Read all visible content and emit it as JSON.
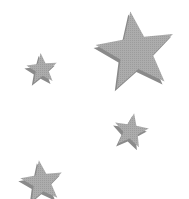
{
  "image": {
    "background": "#ffffff",
    "description": "Four gray five-pointed stars with drop shadows on white background"
  },
  "colors": {
    "star_fill": "#a9a9a9",
    "star_shadow": "#8a8a8a"
  },
  "stars": [
    {
      "name": "large-star",
      "cx": 136,
      "cy": 52,
      "r": 41,
      "rotation": -8
    },
    {
      "name": "small-star-left",
      "cx": 42,
      "cy": 69,
      "r": 16,
      "rotation": -5
    },
    {
      "name": "medium-star-right",
      "cx": 131,
      "cy": 131,
      "r": 18,
      "rotation": 10
    },
    {
      "name": "star-bottom-left",
      "cx": 42,
      "cy": 182,
      "r": 22,
      "rotation": -8
    }
  ]
}
